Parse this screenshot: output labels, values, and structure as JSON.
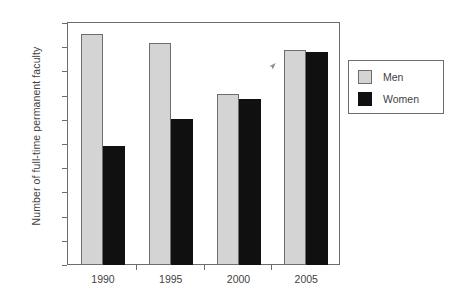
{
  "chart_data": {
    "type": "bar",
    "title": "",
    "subtitle": "",
    "xlabel": "",
    "ylabel": "Number of full-time permanent faculty",
    "categories": [
      "1990",
      "1995",
      "2000",
      "2005"
    ],
    "series": [
      {
        "name": "Men",
        "color": "#d4d4d4",
        "values": [
          4770,
          4590,
          3540,
          4440
        ]
      },
      {
        "name": "Women",
        "color": "#101010",
        "values": [
          2460,
          3010,
          3430,
          4400
        ]
      }
    ],
    "ylim": [
      0,
      5000
    ],
    "yticks": [
      0,
      500,
      1000,
      1500,
      2000,
      2500,
      3000,
      3500,
      4000,
      4500,
      5000
    ],
    "ytick_labels": [
      "0",
      "500",
      "1000",
      "1500",
      "2000",
      "2500",
      "3000",
      "3500",
      "4000",
      "4500",
      "5000"
    ],
    "grid": false,
    "legend_position": "right",
    "legend_entries": [
      "Men",
      "Women"
    ]
  },
  "legend": {
    "entries": [
      {
        "label": "Men",
        "swatch": "men-swatch"
      },
      {
        "label": "Women",
        "swatch": "women-swatch"
      }
    ]
  },
  "artifacts": {
    "cursor_icon": "arrow-cursor-icon"
  }
}
